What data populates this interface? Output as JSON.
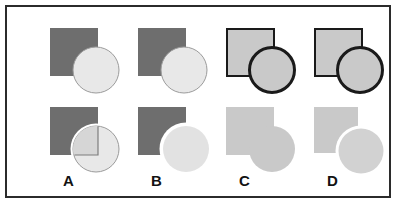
{
  "figure": {
    "kind": "multiple-choice-shape-puzzle",
    "frame": {
      "border_color": "#2b2b2b",
      "background": "#ffffff"
    },
    "palette": {
      "dark_gray": "#6e6e6e",
      "mid_gray": "#c9c9c9",
      "light_gray": "#e8e8e8",
      "outline_dark": "#1a1a1a",
      "outline_soft": "#9b9b9b",
      "white": "#ffffff"
    },
    "options": [
      {
        "label": "A",
        "top": {
          "square": {
            "fill": "#6e6e6e",
            "stroke": "none",
            "x": 27,
            "y": 15,
            "w": 48,
            "h": 48
          },
          "circle": {
            "fill": "#e8e8e8",
            "stroke": "#9b9b9b",
            "stroke_width": 1,
            "cx": 73,
            "cy": 57,
            "r": 23
          },
          "order": "circle-over-square"
        },
        "bottom": {
          "square": {
            "fill": "#6e6e6e",
            "stroke": "none",
            "x": 27,
            "y": 8,
            "w": 48,
            "h": 48
          },
          "circle": {
            "fill": "#e8e8e8",
            "stroke": "#9b9b9b",
            "stroke_width": 1,
            "cx": 73,
            "cy": 50,
            "r": 23
          },
          "halo": {
            "fill": "#ffffff",
            "width": 3
          },
          "overlap_patch": {
            "fill": "#d8d8d8",
            "stroke": "#6e6e6e",
            "stroke_width": 1
          },
          "description": "circle with white halo over square; overlap quadrant drawn as outlined light square"
        }
      },
      {
        "label": "B",
        "top": {
          "square": {
            "fill": "#6e6e6e",
            "stroke": "none",
            "x": 27,
            "y": 15,
            "w": 48,
            "h": 48
          },
          "circle": {
            "fill": "#e8e8e8",
            "stroke": "#9b9b9b",
            "stroke_width": 1,
            "cx": 73,
            "cy": 57,
            "r": 23
          },
          "order": "circle-over-square"
        },
        "bottom": {
          "square": {
            "fill": "#6e6e6e",
            "stroke": "none",
            "x": 27,
            "y": 8,
            "w": 48,
            "h": 48
          },
          "circle": {
            "fill": "#e8e8e8",
            "stroke": "none",
            "cx": 73,
            "cy": 50,
            "r": 23
          },
          "halo": {
            "fill": "#ffffff",
            "width": 4
          },
          "description": "square bitten by white halo of circle; circle solid light gray, no outline"
        }
      },
      {
        "label": "C",
        "top": {
          "square": {
            "fill": "#c9c9c9",
            "stroke": "#1a1a1a",
            "stroke_width": 2,
            "x": 27,
            "y": 15,
            "w": 48,
            "h": 48
          },
          "circle": {
            "fill": "#c9c9c9",
            "stroke": "#1a1a1a",
            "stroke_width": 3,
            "cx": 73,
            "cy": 57,
            "r": 23
          },
          "order": "circle-over-square"
        },
        "bottom": {
          "square": {
            "fill": "#c9c9c9",
            "stroke": "none",
            "x": 27,
            "y": 8,
            "w": 48,
            "h": 48
          },
          "circle": {
            "fill": "#c9c9c9",
            "stroke": "none",
            "cx": 73,
            "cy": 50,
            "r": 23
          },
          "halo": {
            "fill": "none",
            "width": 0
          },
          "description": "square and circle merged into one flat union, no outlines, no gap"
        }
      },
      {
        "label": "D",
        "top": {
          "square": {
            "fill": "#c9c9c9",
            "stroke": "#1a1a1a",
            "stroke_width": 2,
            "x": 27,
            "y": 15,
            "w": 48,
            "h": 48
          },
          "circle": {
            "fill": "#c9c9c9",
            "stroke": "#1a1a1a",
            "stroke_width": 3,
            "cx": 73,
            "cy": 57,
            "r": 23
          },
          "order": "circle-over-square"
        },
        "bottom": {
          "square": {
            "fill": "#c9c9c9",
            "stroke": "none",
            "x": 27,
            "y": 8,
            "w": 48,
            "h": 48
          },
          "circle": {
            "fill": "#c9c9c9",
            "stroke": "none",
            "cx": 73,
            "cy": 50,
            "r": 23
          },
          "halo": {
            "fill": "#ffffff",
            "width": 3
          },
          "description": "square bitten by white halo of circle; circle light gray, no outline"
        }
      }
    ]
  }
}
